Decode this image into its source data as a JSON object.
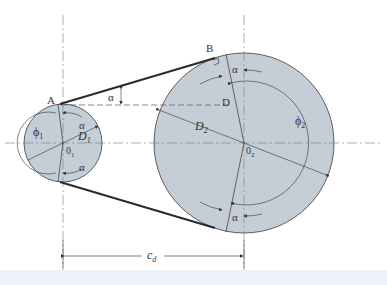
{
  "figure": {
    "colors": {
      "pulley_fill": "#c5ced6",
      "outline": "#3a3a3a",
      "belt": "#2a2a2a",
      "centerline": "#7a7a7a",
      "bottom_strip": "#eef2f8"
    },
    "labels": {
      "point_a": "A",
      "point_b": "B",
      "point_d": "D",
      "alpha_top": "α",
      "alpha_small_top": "α",
      "alpha_small_bottom": "α",
      "alpha_large_top": "α",
      "alpha_large_bottom": "α",
      "phi1": "ϕ",
      "phi1_sub": "1",
      "phi2": "ϕ",
      "phi2_sub": "2",
      "d1": "D",
      "d1_sub": "1",
      "d2": "D",
      "d2_sub": "2",
      "o1": "0",
      "o1_sub": "1",
      "o2": "0",
      "o2_sub": "2",
      "cd": "c",
      "cd_sub": "d"
    }
  }
}
